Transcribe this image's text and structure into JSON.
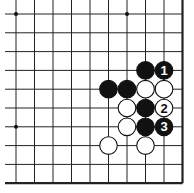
{
  "diagram": {
    "type": "go-board-corner",
    "grid": {
      "x": [
        16,
        34.5,
        53,
        71.5,
        90,
        108.5,
        127,
        145.5,
        164,
        182.5
      ],
      "y": [
        14,
        32.8,
        51.6,
        70.4,
        89.2,
        108,
        126.8,
        145.6,
        164.4,
        183.2
      ],
      "right_edge": true,
      "bottom_edge": true
    },
    "star_points": [
      [
        0,
        0
      ],
      [
        6,
        0
      ],
      [
        0,
        6
      ],
      [
        6,
        6
      ]
    ],
    "stones": [
      {
        "col": 7,
        "row": 3,
        "color": "black",
        "label": ""
      },
      {
        "col": 8,
        "row": 3,
        "color": "black",
        "label": "1"
      },
      {
        "col": 5,
        "row": 4,
        "color": "black",
        "label": ""
      },
      {
        "col": 6,
        "row": 4,
        "color": "black",
        "label": ""
      },
      {
        "col": 7,
        "row": 4,
        "color": "white",
        "label": ""
      },
      {
        "col": 8,
        "row": 4,
        "color": "white",
        "label": ""
      },
      {
        "col": 6,
        "row": 5,
        "color": "white",
        "label": ""
      },
      {
        "col": 7,
        "row": 5,
        "color": "black",
        "label": ""
      },
      {
        "col": 8,
        "row": 5,
        "color": "white",
        "label": "2"
      },
      {
        "col": 6,
        "row": 6,
        "color": "white",
        "label": ""
      },
      {
        "col": 7,
        "row": 6,
        "color": "black",
        "label": ""
      },
      {
        "col": 8,
        "row": 6,
        "color": "black",
        "label": "3"
      },
      {
        "col": 5,
        "row": 7,
        "color": "white",
        "label": ""
      },
      {
        "col": 7,
        "row": 7,
        "color": "white",
        "label": ""
      }
    ]
  }
}
